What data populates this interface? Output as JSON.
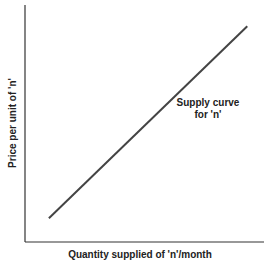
{
  "chart_data": {
    "type": "line",
    "title": "",
    "xlabel": "Quantity supplied of 'n'/month",
    "ylabel": "Price per unit of 'n'",
    "grid": false,
    "legend": null,
    "xlim": [
      0,
      100
    ],
    "ylim": [
      0,
      100
    ],
    "series": [
      {
        "name": "Supply curve for 'n'",
        "x": [
          10,
          93
        ],
        "y": [
          10,
          91
        ],
        "color": "#444444"
      }
    ],
    "annotations": [
      {
        "text_line1": "Supply curve",
        "text_line2": "for 'n'"
      }
    ]
  },
  "labels": {
    "x_axis": "Quantity supplied of 'n'/month",
    "y_axis": "Price per unit of 'n'",
    "annotation_line1": "Supply curve",
    "annotation_line2": "for 'n'"
  }
}
